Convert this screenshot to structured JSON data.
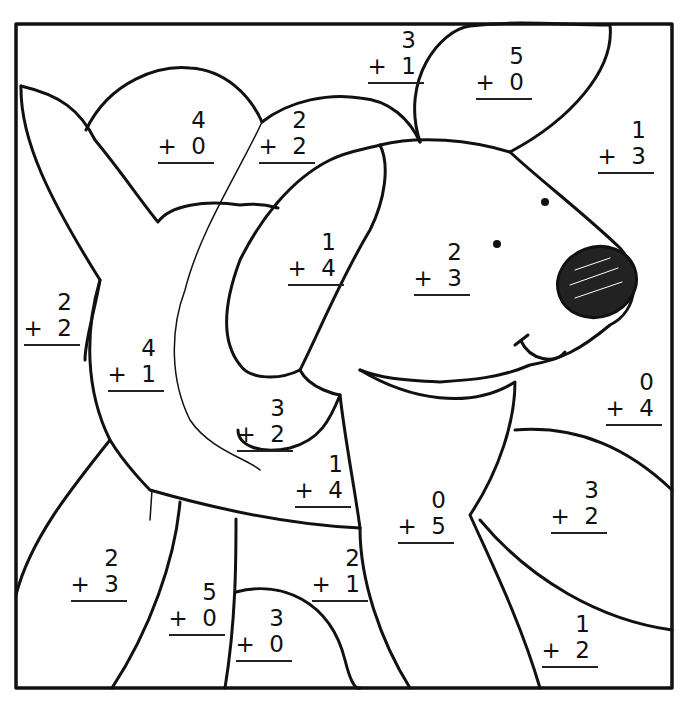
{
  "worksheet": {
    "title": "Color-by-sum dog worksheet",
    "frame": {
      "x": 16,
      "y": 24,
      "w": 656,
      "h": 664
    },
    "problems": [
      {
        "id": "p1",
        "a": "3",
        "b": "1",
        "x": 368,
        "y": 28
      },
      {
        "id": "p2",
        "a": "5",
        "b": "0",
        "x": 476,
        "y": 44
      },
      {
        "id": "p3",
        "a": "4",
        "b": "0",
        "x": 158,
        "y": 108
      },
      {
        "id": "p4",
        "a": "2",
        "b": "2",
        "x": 259,
        "y": 108
      },
      {
        "id": "p5",
        "a": "1",
        "b": "3",
        "x": 598,
        "y": 118
      },
      {
        "id": "p6",
        "a": "1",
        "b": "4",
        "x": 288,
        "y": 230
      },
      {
        "id": "p7",
        "a": "2",
        "b": "3",
        "x": 414,
        "y": 240
      },
      {
        "id": "p8",
        "a": "2",
        "b": "2",
        "x": 24,
        "y": 290
      },
      {
        "id": "p9",
        "a": "4",
        "b": "1",
        "x": 108,
        "y": 336
      },
      {
        "id": "p10",
        "a": "0",
        "b": "4",
        "x": 606,
        "y": 370
      },
      {
        "id": "p11",
        "a": "3",
        "b": "2",
        "x": 237,
        "y": 396
      },
      {
        "id": "p12",
        "a": "1",
        "b": "4",
        "x": 295,
        "y": 452
      },
      {
        "id": "p13",
        "a": "0",
        "b": "5",
        "x": 398,
        "y": 488
      },
      {
        "id": "p14",
        "a": "3",
        "b": "2",
        "x": 551,
        "y": 478
      },
      {
        "id": "p15",
        "a": "2",
        "b": "3",
        "x": 71,
        "y": 546
      },
      {
        "id": "p16",
        "a": "2",
        "b": "1",
        "x": 312,
        "y": 546
      },
      {
        "id": "p17",
        "a": "5",
        "b": "0",
        "x": 169,
        "y": 580
      },
      {
        "id": "p18",
        "a": "3",
        "b": "0",
        "x": 236,
        "y": 606
      },
      {
        "id": "p19",
        "a": "1",
        "b": "2",
        "x": 542,
        "y": 612
      }
    ],
    "operator": "+",
    "colors": {
      "ink": "#111111",
      "paper": "#ffffff"
    }
  }
}
